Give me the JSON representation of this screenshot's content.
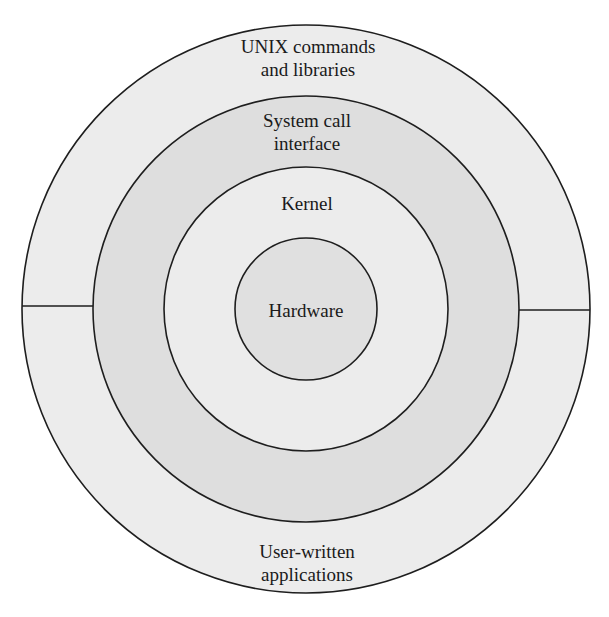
{
  "diagram": {
    "type": "concentric-layers",
    "title": "",
    "center": {
      "x": 306,
      "y": 309
    },
    "layers": [
      {
        "id": "user-space",
        "radius": 284,
        "fill": "#ececec",
        "label_top": [
          "UNIX commands",
          "and libraries"
        ],
        "label_bottom": [
          "User-written",
          "applications"
        ],
        "split": "horizontal"
      },
      {
        "id": "system-call-interface",
        "radius": 213,
        "fill": "#dedede",
        "label_top": [
          "System call",
          "interface"
        ]
      },
      {
        "id": "kernel",
        "radius": 142,
        "fill": "#ececec",
        "label_top": [
          "Kernel"
        ]
      },
      {
        "id": "hardware",
        "radius": 71,
        "fill": "#e0e0e0",
        "label_center": [
          "Hardware"
        ]
      }
    ],
    "labels": {
      "unix_commands_line1": "UNIX commands",
      "unix_commands_line2": "and libraries",
      "user_written_line1": "User-written",
      "user_written_line2": "applications",
      "syscall_line1": "System call",
      "syscall_line2": "interface",
      "kernel": "Kernel",
      "hardware": "Hardware"
    },
    "colors": {
      "stroke": "#1e1e1e",
      "outer_fill": "#ececec",
      "syscall_fill": "#dedede",
      "kernel_fill": "#ececec",
      "hardware_fill": "#e0e0e0",
      "text": "#1a1a1a"
    }
  }
}
